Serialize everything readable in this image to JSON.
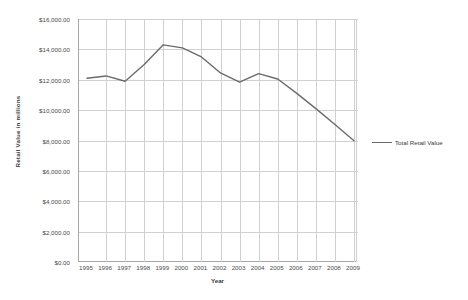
{
  "chart_data": {
    "type": "line",
    "title": "",
    "xlabel": "Year",
    "ylabel": "Retail  Value in millions",
    "categories": [
      1995,
      1996,
      1997,
      1998,
      1999,
      2000,
      2001,
      2002,
      2003,
      2004,
      2005,
      2006,
      2007,
      2008,
      2009
    ],
    "x_tick_labels": [
      "1995",
      "1996",
      "1997",
      "1998",
      "1999",
      "2000",
      "2001",
      "2002",
      "2003",
      "2004",
      "2005",
      "2006",
      "2007",
      "2008",
      "2009"
    ],
    "y_tick_labels": [
      "$0.00",
      "$2,000.00",
      "$4,000.00",
      "$6,000.00",
      "$8,000.00",
      "$10,000.00",
      "$12,000.00",
      "$14,000.00",
      "$16,000.00"
    ],
    "y_tick_values": [
      0,
      2000,
      4000,
      6000,
      8000,
      10000,
      12000,
      14000,
      16000
    ],
    "ylim": [
      0,
      16000
    ],
    "xlim": [
      1995,
      2009
    ],
    "grid": true,
    "legend_position": "right",
    "series": [
      {
        "name": "Total Retail Value",
        "color": "#6b6b6b",
        "values": [
          12100,
          12250,
          11900,
          13000,
          14300,
          14100,
          13500,
          12450,
          11850,
          12400,
          12050,
          11100,
          10100,
          9050,
          7980
        ]
      }
    ]
  },
  "legend": {
    "entries": [
      {
        "label": "Total Retail Value",
        "color": "#6b6b6b"
      }
    ]
  },
  "axes": {
    "x_title": "Year",
    "y_title": "Retail  Value in millions"
  }
}
